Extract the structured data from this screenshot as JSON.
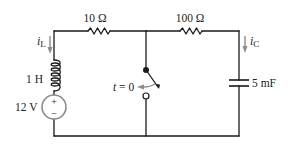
{
  "diagram": {
    "type": "circuit",
    "colors": {
      "wire": "#1a1a1a",
      "arrow": "#8a8a8a",
      "source_circle": "#8a8a8a",
      "text": "#222222"
    },
    "components": {
      "resistor_1": {
        "label": "10 Ω"
      },
      "resistor_2": {
        "label": "100 Ω"
      },
      "inductor": {
        "label": "1 H"
      },
      "voltage_source": {
        "label": "12 V",
        "plus": "+",
        "minus": "−"
      },
      "capacitor": {
        "label": "5 mF"
      },
      "switch": {
        "label_t": "t",
        "label_eq": " = 0"
      }
    },
    "currents": {
      "inductor_current": {
        "symbol": "i",
        "subscript": "L"
      },
      "capacitor_current": {
        "symbol": "i",
        "subscript": "C"
      }
    }
  }
}
